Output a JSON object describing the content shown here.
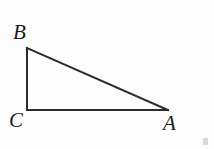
{
  "figure": {
    "kind": "geometry-diagram",
    "background_color": "#fdfdfd",
    "stroke_color": "#2b2b2b",
    "label_color": "#1b1b1b",
    "stroke_width": 2,
    "canvas": {
      "width": 214,
      "height": 149
    },
    "vertices": [
      {
        "name": "B",
        "label": "B",
        "x": 27,
        "y": 48,
        "label_x": 13,
        "label_y": 22,
        "position": "top-left"
      },
      {
        "name": "C",
        "label": "C",
        "x": 27,
        "y": 110,
        "label_x": 9,
        "label_y": 110,
        "position": "bottom-left",
        "right_angle": true
      },
      {
        "name": "A",
        "label": "A",
        "x": 168,
        "y": 110,
        "label_x": 163,
        "label_y": 113,
        "position": "bottom-right"
      }
    ],
    "edges": [
      {
        "name": "BC",
        "from": "B",
        "to": "C",
        "role": "vertical-leg"
      },
      {
        "name": "CA",
        "from": "C",
        "to": "A",
        "role": "horizontal-leg"
      },
      {
        "name": "AB",
        "from": "A",
        "to": "B",
        "role": "hypotenuse"
      }
    ],
    "artifact": {
      "name": "corner-smudge",
      "x": 203,
      "y": 138,
      "color": "#b9b9b9"
    }
  }
}
